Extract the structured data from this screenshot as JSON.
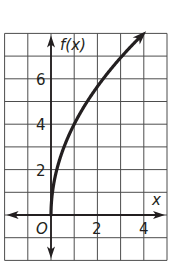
{
  "chart_data": {
    "type": "line",
    "title": "",
    "xlabel": "x",
    "ylabel": "f(x)",
    "origin_label": "O",
    "x_tick_labels": [
      "2",
      "4"
    ],
    "y_tick_labels": [
      "2",
      "4",
      "6"
    ],
    "xlim": [
      -2,
      5
    ],
    "ylim": [
      -2,
      8
    ],
    "grid": true,
    "grid_step": 1,
    "series": [
      {
        "name": "f(x)",
        "function": "4*sqrt(x)",
        "x": [
          0,
          0.0625,
          0.25,
          0.5,
          1,
          1.5,
          2,
          2.5,
          3,
          3.5,
          4,
          4.1
        ],
        "y": [
          0,
          1,
          2,
          2.83,
          4,
          4.9,
          5.66,
          6.32,
          6.93,
          7.48,
          8,
          8.1
        ],
        "arrow_end": true,
        "color": "#231f20"
      }
    ]
  }
}
